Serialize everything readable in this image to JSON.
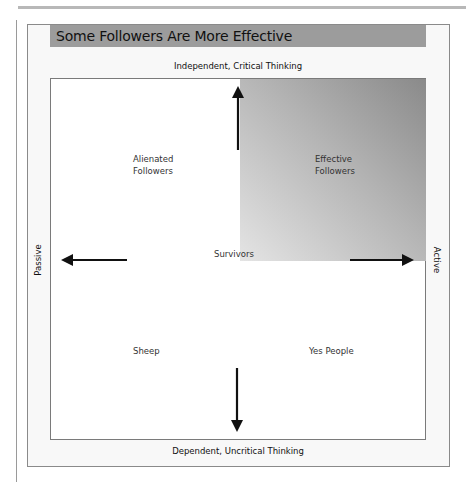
{
  "title": "Some Followers Are More Effective",
  "axes": {
    "top": "Independent, Critical Thinking",
    "bottom": "Dependent, Uncritical Thinking",
    "left": "Passive",
    "right": "Active"
  },
  "quadrants": {
    "top_left": {
      "line1": "Alienated",
      "line2": "Followers"
    },
    "top_right": {
      "line1": "Effective",
      "line2": "Followers",
      "shaded": true
    },
    "bottom_left": {
      "line1": "Sheep"
    },
    "bottom_right": {
      "line1": "Yes People"
    },
    "center": {
      "line1": "Survivors"
    }
  },
  "arrows": [
    "up",
    "down",
    "left",
    "right"
  ],
  "colors": {
    "title_bar": "#9c9c9c",
    "shade_dark": "#8a8a8a",
    "shade_light": "#e4e4e4",
    "arrow": "#111111"
  }
}
